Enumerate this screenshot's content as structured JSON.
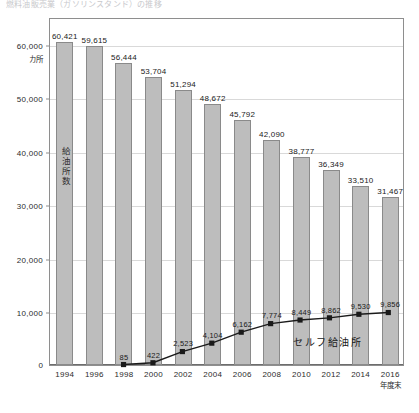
{
  "page": {
    "title": "燃料油販売業（ガソリンスタンド）の推移"
  },
  "chart_data": {
    "type": "bar",
    "title": "",
    "xlabel": "年度末",
    "ylabel": "カ所",
    "ylim": [
      0,
      65000
    ],
    "grid": true,
    "legend_position": "inline-annotation",
    "categories": [
      "1994",
      "1996",
      "1998",
      "2000",
      "2002",
      "2004",
      "2006",
      "2008",
      "2010",
      "2012",
      "2014",
      "2016"
    ],
    "yticks": [
      "60,000",
      "50,000",
      "40,000",
      "30,000",
      "20,000",
      "10,000"
    ],
    "ytick_values": [
      60000,
      50000,
      40000,
      30000,
      20000,
      10000
    ],
    "zero_label": "0",
    "y_unit": "カ所",
    "x_unit": "年度末",
    "series": [
      {
        "name": "給油所数",
        "type": "bar",
        "color": "#bdbdbd",
        "values": [
          60421,
          59615,
          56444,
          53704,
          51294,
          48672,
          45792,
          42090,
          38777,
          36349,
          33510,
          31467
        ],
        "labels": [
          "60,421",
          "59,615",
          "56,444",
          "53,704",
          "51,294",
          "48,672",
          "45,792",
          "42,090",
          "38,777",
          "36,349",
          "33,510",
          "31,467"
        ],
        "inline_label": "給油所数"
      },
      {
        "name": "セルフ給油所",
        "type": "line",
        "color": "#1a1a1a",
        "values": [
          null,
          null,
          85,
          422,
          2523,
          4104,
          6162,
          7774,
          8449,
          8862,
          9530,
          9856
        ],
        "labels": [
          "",
          "",
          "85",
          "422",
          "2,523",
          "4,104",
          "6,162",
          "7,774",
          "8,449",
          "8,862",
          "9,530",
          "9,856"
        ],
        "inline_label": "セルフ給油所"
      }
    ]
  }
}
